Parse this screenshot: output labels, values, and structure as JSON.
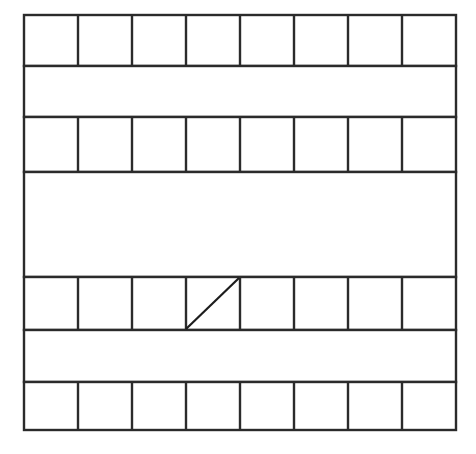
{
  "figure": {
    "background_color": "#ffffff",
    "line_color": "#2b2b2b",
    "diagonal_color": "#1d1d1d",
    "line_width": 2.4,
    "grid": {
      "left": 24,
      "right": 456,
      "width": 432,
      "columns": 8,
      "column_width": 54
    },
    "bands": [
      {
        "id": "band-1",
        "kind": "divided",
        "top": 15,
        "bottom": 66,
        "height": 51,
        "cells": 8,
        "label": "Row 1 divided into eight cells"
      },
      {
        "id": "band-2",
        "kind": "plain",
        "top": 66,
        "bottom": 117,
        "height": 51,
        "cells": 0,
        "label": "Row 2 undivided band"
      },
      {
        "id": "band-3",
        "kind": "divided",
        "top": 117,
        "bottom": 172,
        "height": 55,
        "cells": 8,
        "label": "Row 3 divided into eight cells"
      },
      {
        "id": "band-4",
        "kind": "plain",
        "top": 172,
        "bottom": 277,
        "height": 105,
        "cells": 0,
        "label": "Row 4 tall undivided band"
      },
      {
        "id": "band-5",
        "kind": "divided",
        "top": 277,
        "bottom": 330,
        "height": 53,
        "cells": 8,
        "label": "Row 5 divided into eight cells with diagonal mark"
      },
      {
        "id": "band-6",
        "kind": "plain",
        "top": 330,
        "bottom": 382,
        "height": 52,
        "cells": 0,
        "label": "Row 6 undivided band"
      },
      {
        "id": "band-7",
        "kind": "divided",
        "top": 382,
        "bottom": 430,
        "height": 48,
        "cells": 8,
        "label": "Row 7 divided into eight cells"
      }
    ],
    "marks": [
      {
        "id": "diagonal-1",
        "type": "diagonal",
        "band_id": "band-5",
        "cell_index": 4,
        "direction": "bottom-left-to-top-right",
        "x1": 186,
        "y1": 329,
        "x2": 239,
        "y2": 278,
        "label": "Diagonal stroke in row 5, cell 4"
      }
    ]
  }
}
